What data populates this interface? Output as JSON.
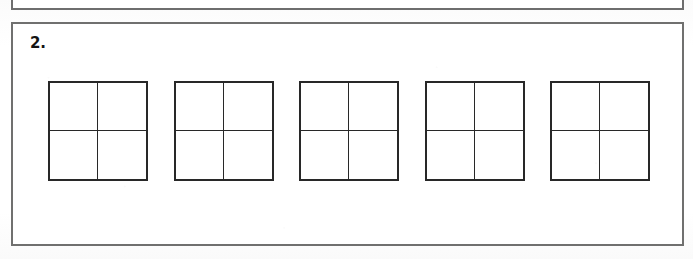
{
  "page": {
    "background_color": "#fdfdfd",
    "paper_color": "#ffffff"
  },
  "previous_exercise": {
    "name": "partial-exercise-box-above",
    "border_color": "#6e6e6e",
    "visible_portion": "bottom-edge-only"
  },
  "exercise": {
    "number_label": "2.",
    "border_color": "#70706f",
    "figure_count": 5,
    "figures": [
      {
        "label": "grid-figure-1",
        "rows": 2,
        "columns": 2,
        "cell_count": 4,
        "line_color": "#282828",
        "fill": "empty"
      },
      {
        "label": "grid-figure-2",
        "rows": 2,
        "columns": 2,
        "cell_count": 4,
        "line_color": "#282828",
        "fill": "empty"
      },
      {
        "label": "grid-figure-3",
        "rows": 2,
        "columns": 2,
        "cell_count": 4,
        "line_color": "#282828",
        "fill": "empty"
      },
      {
        "label": "grid-figure-4",
        "rows": 2,
        "columns": 2,
        "cell_count": 4,
        "line_color": "#282828",
        "fill": "empty"
      },
      {
        "label": "grid-figure-5",
        "rows": 2,
        "columns": 2,
        "cell_count": 4,
        "line_color": "#282828",
        "fill": "empty"
      }
    ]
  }
}
